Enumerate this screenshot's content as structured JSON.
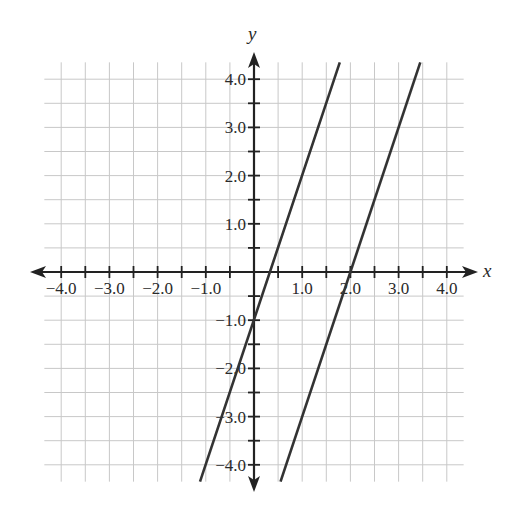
{
  "chart_data": {
    "type": "line",
    "title": "",
    "xlabel": "x",
    "ylabel": "y",
    "xlim": [
      -4.35,
      4.35
    ],
    "ylim": [
      -4.35,
      4.35
    ],
    "grid": true,
    "grid_step": 0.5,
    "x_ticks": [
      -4.0,
      -3.0,
      -2.0,
      -1.0,
      1.0,
      2.0,
      3.0,
      4.0
    ],
    "x_tick_labels": [
      "−4.0",
      "−3.0",
      "−2.0",
      "−1.0",
      "1.0",
      "2.0",
      "3.0",
      "4.0"
    ],
    "y_ticks": [
      4.0,
      3.0,
      2.0,
      1.0,
      -1.0,
      -2.0,
      -3.0,
      -4.0
    ],
    "y_tick_labels": [
      "4.0",
      "3.0",
      "2.0",
      "1.0",
      "−1.0",
      "−2.0",
      "−3.0",
      "−4.0"
    ],
    "series": [
      {
        "name": "line 1",
        "equation": "y = 3x - 1",
        "slope": 3,
        "intercept": -1,
        "x": [
          -1.12,
          1.78
        ],
        "y": [
          -4.35,
          4.35
        ]
      },
      {
        "name": "line 2",
        "equation": "y = 3x - 6",
        "slope": 3,
        "intercept": -6,
        "x": [
          0.55,
          3.45
        ],
        "y": [
          -4.35,
          4.35
        ]
      }
    ],
    "legend": null,
    "colors": {
      "grid": "#c8c8c8",
      "axis": "#222222",
      "line": "#333333",
      "background": "#ffffff"
    }
  }
}
